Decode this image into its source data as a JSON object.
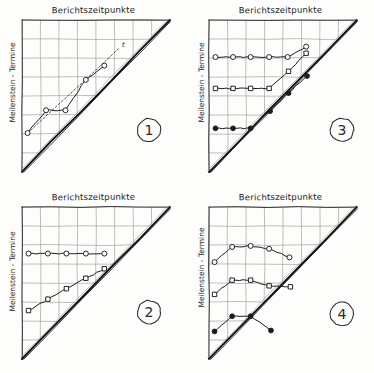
{
  "figure": {
    "kind": "milestone-trend-analysis",
    "panel_count": 4,
    "ink_color": "#1c1c1c",
    "grid_color": "#9a9a96",
    "diagonal_color": "#111111"
  },
  "labels": {
    "x_axis": "Berichtszeitpunkte",
    "y_axis": "Meilenstein - Termine",
    "trend_marker": "t"
  },
  "panels": [
    {
      "number": "1",
      "badge": "1",
      "title": "Berichtszeitpunkte",
      "ylabel": "Meilenstein - Termine",
      "has_trend_line": true,
      "trend_label": "t",
      "series": [
        {
          "name": "milestone-a",
          "marker": "open-circle",
          "points": [
            [
              0.3,
              2.05
            ],
            [
              1.3,
              3.25
            ],
            [
              2.35,
              3.25
            ],
            [
              3.45,
              4.85
            ],
            [
              4.45,
              5.6
            ]
          ]
        }
      ]
    },
    {
      "number": "2",
      "badge": "2",
      "title": "Berichtszeitpunkte",
      "ylabel": "Meilenstein - Termine",
      "has_trend_line": false,
      "series": [
        {
          "name": "milestone-a",
          "marker": "open-circle",
          "points": [
            [
              0.35,
              5.55
            ],
            [
              1.4,
              5.55
            ],
            [
              2.4,
              5.55
            ],
            [
              3.45,
              5.55
            ],
            [
              4.45,
              5.55
            ]
          ]
        },
        {
          "name": "milestone-b",
          "marker": "open-square",
          "points": [
            [
              0.35,
              2.55
            ],
            [
              1.4,
              3.15
            ],
            [
              2.4,
              3.7
            ],
            [
              3.45,
              4.25
            ],
            [
              4.45,
              4.75
            ]
          ]
        }
      ]
    },
    {
      "number": "3",
      "badge": "3",
      "title": "Berichtszeitpunkte",
      "ylabel": "Meilenstein - Termine",
      "has_trend_line": false,
      "series": [
        {
          "name": "milestone-a",
          "marker": "open-circle",
          "points": [
            [
              0.35,
              6.05
            ],
            [
              1.3,
              6.05
            ],
            [
              2.25,
              6.05
            ],
            [
              3.25,
              6.05
            ],
            [
              4.25,
              6.05
            ],
            [
              5.25,
              6.6
            ]
          ]
        },
        {
          "name": "milestone-b",
          "marker": "open-square",
          "points": [
            [
              0.35,
              4.4
            ],
            [
              1.3,
              4.4
            ],
            [
              2.25,
              4.4
            ],
            [
              3.25,
              4.4
            ],
            [
              4.3,
              5.3
            ],
            [
              5.25,
              6.25
            ]
          ]
        },
        {
          "name": "milestone-c",
          "marker": "filled-circle",
          "points": [
            [
              0.35,
              2.3
            ],
            [
              1.3,
              2.3
            ],
            [
              2.25,
              2.3
            ],
            [
              3.3,
              3.2
            ],
            [
              4.3,
              4.15
            ],
            [
              5.3,
              5.05
            ]
          ]
        }
      ]
    },
    {
      "number": "4",
      "badge": "4",
      "title": "Berichtszeitpunkte",
      "ylabel": "Meilenstein - Termine",
      "has_trend_line": false,
      "series": [
        {
          "name": "milestone-a",
          "marker": "open-circle",
          "points": [
            [
              0.3,
              5.1
            ],
            [
              1.25,
              5.9
            ],
            [
              2.25,
              5.95
            ],
            [
              3.25,
              5.8
            ],
            [
              4.35,
              5.35
            ]
          ]
        },
        {
          "name": "milestone-b",
          "marker": "open-square",
          "points": [
            [
              0.3,
              3.4
            ],
            [
              1.25,
              4.15
            ],
            [
              2.25,
              4.15
            ],
            [
              3.25,
              3.85
            ],
            [
              4.4,
              3.8
            ]
          ]
        },
        {
          "name": "milestone-c",
          "marker": "filled-circle",
          "points": [
            [
              0.3,
              1.45
            ],
            [
              1.25,
              2.25
            ],
            [
              2.25,
              2.25
            ],
            [
              3.35,
              1.5
            ]
          ]
        }
      ]
    }
  ],
  "grid": {
    "cols": 8,
    "rows": 8
  }
}
